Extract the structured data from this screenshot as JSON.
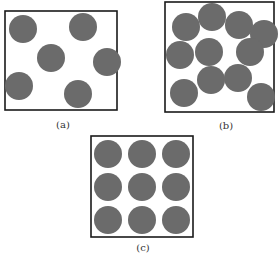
{
  "colors": {
    "particle": "#6b6b6b",
    "box_stroke": "#1a1a1a",
    "background": "#ffffff"
  },
  "panels": [
    {
      "id": "a",
      "label": "(a)",
      "description": "few particles, widely spaced, disordered",
      "box": {
        "x": 5,
        "y": 11,
        "w": 112,
        "h": 99
      },
      "label_pos": {
        "x": 63,
        "y": 128
      },
      "particles": [
        {
          "cx": 23,
          "cy": 29,
          "r": 14
        },
        {
          "cx": 83,
          "cy": 27,
          "r": 14
        },
        {
          "cx": 51,
          "cy": 58,
          "r": 14
        },
        {
          "cx": 107,
          "cy": 62,
          "r": 14
        },
        {
          "cx": 19,
          "cy": 86,
          "r": 14
        },
        {
          "cx": 78,
          "cy": 94,
          "r": 14
        }
      ]
    },
    {
      "id": "b",
      "label": "(b)",
      "description": "many particles, closely packed, disordered",
      "box": {
        "x": 165,
        "y": 2,
        "w": 109,
        "h": 110
      },
      "label_pos": {
        "x": 226,
        "y": 129
      },
      "particles": [
        {
          "cx": 186,
          "cy": 27,
          "r": 14
        },
        {
          "cx": 212,
          "cy": 17,
          "r": 14
        },
        {
          "cx": 239,
          "cy": 25,
          "r": 14
        },
        {
          "cx": 264,
          "cy": 34,
          "r": 14
        },
        {
          "cx": 180,
          "cy": 55,
          "r": 14
        },
        {
          "cx": 209,
          "cy": 52,
          "r": 14
        },
        {
          "cx": 250,
          "cy": 52,
          "r": 14
        },
        {
          "cx": 211,
          "cy": 80,
          "r": 14
        },
        {
          "cx": 238,
          "cy": 78,
          "r": 14
        },
        {
          "cx": 184,
          "cy": 93,
          "r": 14
        },
        {
          "cx": 261,
          "cy": 97,
          "r": 14
        }
      ]
    },
    {
      "id": "c",
      "label": "(c)",
      "description": "particles in an ordered 3x3 lattice",
      "box": {
        "x": 91,
        "y": 136,
        "w": 102,
        "h": 101
      },
      "label_pos": {
        "x": 143,
        "y": 251
      },
      "particles": [
        {
          "cx": 108,
          "cy": 154,
          "r": 14
        },
        {
          "cx": 142,
          "cy": 154,
          "r": 14
        },
        {
          "cx": 176,
          "cy": 154,
          "r": 14
        },
        {
          "cx": 108,
          "cy": 187,
          "r": 14
        },
        {
          "cx": 142,
          "cy": 187,
          "r": 14
        },
        {
          "cx": 176,
          "cy": 187,
          "r": 14
        },
        {
          "cx": 108,
          "cy": 220,
          "r": 14
        },
        {
          "cx": 142,
          "cy": 220,
          "r": 14
        },
        {
          "cx": 176,
          "cy": 220,
          "r": 14
        }
      ]
    }
  ]
}
